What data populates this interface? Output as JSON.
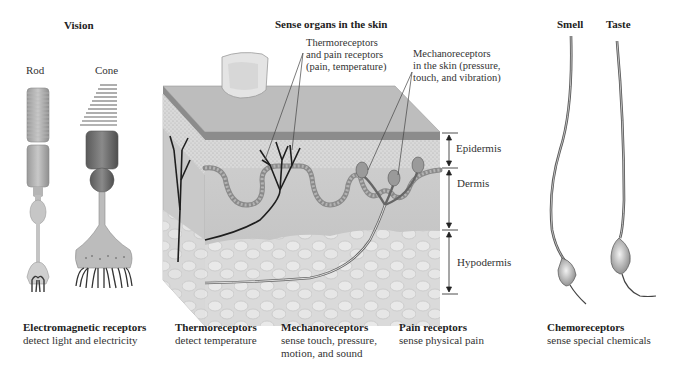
{
  "sections": {
    "vision": {
      "title": "Vision",
      "rod_label": "Rod",
      "cone_label": "Cone"
    },
    "skin": {
      "title": "Sense organs in the skin",
      "annotation_thermo": "Thermoreceptors\nand pain receptors\n(pain, temperature)",
      "annotation_mechano": "Mechanoreceptors\nin the skin (pressure,\ntouch, and vibration)",
      "layers": [
        "Epidermis",
        "Dermis",
        "Hypodermis"
      ]
    },
    "chemo": {
      "smell_label": "Smell",
      "taste_label": "Taste"
    }
  },
  "captions": [
    {
      "title": "Electromagnetic receptors",
      "desc": "detect light and electricity"
    },
    {
      "title": "Thermoreceptors",
      "desc": "detect temperature"
    },
    {
      "title": "Mechanoreceptors",
      "desc": "sense touch, pressure,\nmotion, and sound"
    },
    {
      "title": "Pain receptors",
      "desc": "sense physical pain"
    },
    {
      "title": "Chemoreceptors",
      "desc": "sense special chemicals"
    }
  ],
  "colors": {
    "background": "#ffffff",
    "text": "#222222",
    "epidermis_top": "#8c8c8c",
    "dermis": "#c4c4c4",
    "hypodermis": "#dcdcdc",
    "nerve_dark": "#1e1e1e"
  }
}
